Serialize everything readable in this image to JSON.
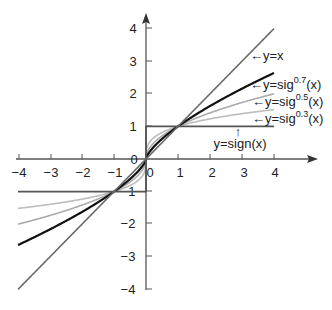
{
  "chart_data": {
    "type": "line",
    "title": "",
    "xlabel": "",
    "ylabel": "",
    "xlim": [
      -4,
      4
    ],
    "ylim": [
      -4,
      4
    ],
    "grid": false,
    "x_ticks": [
      -4,
      -3,
      -2,
      -1,
      0,
      1,
      2,
      3,
      4
    ],
    "y_ticks": [
      -4,
      -3,
      -2,
      -1,
      0,
      1,
      2,
      3,
      4
    ],
    "x_tick_labels": [
      "−4",
      "−3",
      "−2",
      "−1",
      "0",
      "1",
      "2",
      "3",
      "4"
    ],
    "y_tick_labels_pos": [
      "1",
      "2",
      "3",
      "4"
    ],
    "y_tick_labels_neg": [
      "−1",
      "−2",
      "−3",
      "−4"
    ],
    "origin_label": "0",
    "series": [
      {
        "name": "y=x",
        "formula": "x",
        "power": 1,
        "color": "#6a6a6a",
        "width": 1.6,
        "x": [
          -4,
          -3,
          -2,
          -1,
          0,
          1,
          2,
          3,
          4
        ],
        "values": [
          -4,
          -3,
          -2,
          -1,
          0,
          1,
          2,
          3,
          4
        ]
      },
      {
        "name": "y=sig^0.7(x)",
        "formula": "sign(x)|x|^0.7",
        "power": 0.7,
        "color": "#111111",
        "width": 2.2,
        "x": [
          -4,
          -3,
          -2,
          -1,
          0,
          1,
          2,
          3,
          4
        ],
        "values": [
          -2.64,
          -2.16,
          -1.62,
          -1,
          0,
          1,
          1.62,
          2.16,
          2.64
        ]
      },
      {
        "name": "y=sig^0.5(x)",
        "formula": "sign(x)|x|^0.5",
        "power": 0.5,
        "color": "#ababab",
        "width": 1.6,
        "x": [
          -4,
          -3,
          -2,
          -1,
          0,
          1,
          2,
          3,
          4
        ],
        "values": [
          -2,
          -1.73,
          -1.41,
          -1,
          0,
          1,
          1.41,
          1.73,
          2
        ]
      },
      {
        "name": "y=sig^0.3(x)",
        "formula": "sign(x)|x|^0.3",
        "power": 0.3,
        "color": "#bdbdbd",
        "width": 1.6,
        "x": [
          -4,
          -3,
          -2,
          -1,
          0,
          1,
          2,
          3,
          4
        ],
        "values": [
          -1.52,
          -1.39,
          -1.23,
          -1,
          0,
          1,
          1.23,
          1.39,
          1.52
        ]
      },
      {
        "name": "y=sign(x)",
        "formula": "sign(x)",
        "power": 0,
        "color": "#555555",
        "width": 1.8,
        "x": [
          -4,
          0,
          0,
          4
        ],
        "values": [
          -1,
          -1,
          1,
          1
        ]
      }
    ],
    "annotations": [
      {
        "text": "←y=x",
        "x": 3.3,
        "y": 3.1
      },
      {
        "text_main": "←y=sig",
        "exponent": "0.7",
        "suffix": "(x)",
        "x": 3.3,
        "y": 2.2
      },
      {
        "text_main": "←y=sig",
        "exponent": "0.5",
        "suffix": "(x)",
        "x": 3.3,
        "y": 1.7
      },
      {
        "text_main": "←y=sig",
        "exponent": "0.3",
        "suffix": "(x)",
        "x": 3.3,
        "y": 1.2
      },
      {
        "arrow": "↑",
        "text": "y=sign(x)",
        "x": 2.9,
        "y": 0.5
      }
    ]
  },
  "labels": {
    "yx": "←y=x",
    "sig_main": "←y=sig",
    "exp07": "0.7",
    "exp05": "0.5",
    "exp03": "0.3",
    "suffix": "(x)",
    "sign_arrow": "↑",
    "sign_text": "y=sign(x)",
    "origin": "0",
    "x_zero": "0",
    "xt_m4": "−4",
    "xt_m3": "−3",
    "xt_m2": "−2",
    "xt_m1": "−1",
    "xt_1": "1",
    "xt_2": "2",
    "xt_3": "3",
    "xt_4": "4",
    "yt_1": "1",
    "yt_2": "2",
    "yt_3": "3",
    "yt_4": "4",
    "yt_m1": "−1",
    "yt_m2": "−2",
    "yt_m3": "−3",
    "yt_m4": "−4"
  }
}
